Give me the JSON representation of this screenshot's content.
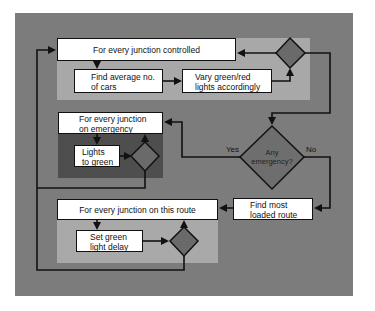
{
  "diagram": {
    "nodes": {
      "junction_controlled": "For every junction controlled",
      "find_average_line1": "Find average no.",
      "find_average_line2": "of cars",
      "vary_lights_line1": "Vary green/red",
      "vary_lights_line2": "lights accordingly",
      "junction_emergency_line1": "For every junction",
      "junction_emergency_line2": "on emergency",
      "lights_green_line1": "Lights",
      "lights_green_line2": "to green",
      "any_emergency_line1": "Any",
      "any_emergency_line2": "emergency?",
      "find_loaded_line1": "Find most",
      "find_loaded_line2": "loaded route",
      "junction_route": "For every junction on this route",
      "set_delay_line1": "Set green",
      "set_delay_line2": "light delay"
    },
    "edge_labels": {
      "yes": "Yes",
      "no": "No"
    },
    "colors": {
      "background": "#7c7c7c",
      "panel_light": "#a8a8a8",
      "panel_dark": "#4e4e4e",
      "decision_fill": "#6a6a6a",
      "box_fill": "#ffffff",
      "line": "#111111"
    }
  }
}
